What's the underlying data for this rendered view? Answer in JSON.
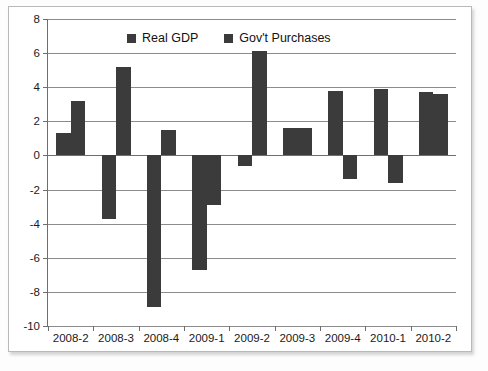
{
  "chart_data": {
    "type": "bar",
    "title": "",
    "xlabel": "",
    "ylabel": "",
    "grid": true,
    "legend_position": "top-center",
    "ylim": [
      -10,
      8
    ],
    "ytick_step": 2,
    "yticks": [
      "8",
      "6",
      "4",
      "2",
      "0",
      "-2",
      "-4",
      "-6",
      "-8",
      "-10"
    ],
    "ytick_values": [
      8,
      6,
      4,
      2,
      0,
      -2,
      -4,
      -6,
      -8,
      -10
    ],
    "categories": [
      "2008-2",
      "2008-3",
      "2008-4",
      "2009-1",
      "2009-2",
      "2009-3",
      "2009-4",
      "2010-1",
      "2010-2"
    ],
    "series": [
      {
        "name": "Real GDP",
        "color": "#3b3b3b",
        "values": [
          1.3,
          -3.7,
          -8.9,
          -6.7,
          -0.6,
          1.6,
          3.8,
          3.9,
          3.7
        ]
      },
      {
        "name": "Gov't Purchases",
        "color": "#3b3b3b",
        "values": [
          3.2,
          5.2,
          1.5,
          -2.9,
          6.1,
          1.6,
          -1.4,
          -1.6,
          3.6
        ]
      }
    ]
  },
  "legend": {
    "items": [
      {
        "label": "Real GDP",
        "swatch": "legend-swatch-real-gdp"
      },
      {
        "label": "Gov't Purchases",
        "swatch": "legend-swatch-govt-purchases"
      }
    ]
  },
  "colors": {
    "bar": "#3b3b3b",
    "grid": "#8c8c8c",
    "axis": "#6e6e6e",
    "frame": "#b9b9b9",
    "background": "#ffffff",
    "text": "#1a1a1a"
  }
}
